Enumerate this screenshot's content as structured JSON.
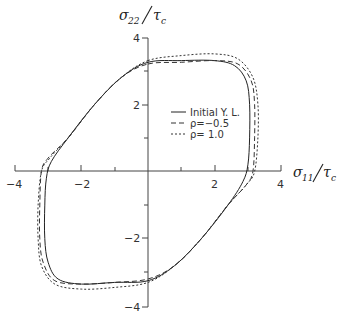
{
  "chart_data": {
    "type": "line",
    "title": "",
    "xlabel": "σ11/τc",
    "ylabel": "σ22/τc",
    "xlim": [
      -4,
      4
    ],
    "ylim": [
      -4,
      4
    ],
    "grid": false,
    "legend_position": "inside upper right",
    "x_ticks": [
      "-4",
      "-2",
      "2",
      "4"
    ],
    "y_ticks": [
      "4",
      "2",
      "-2",
      "-4"
    ],
    "series": [
      {
        "name": "Initial Y. L.",
        "style": "solid",
        "points": [
          [
            0,
            3.25
          ],
          [
            1.0,
            3.3
          ],
          [
            2.0,
            3.3
          ],
          [
            2.6,
            3.15
          ],
          [
            2.95,
            2.7
          ],
          [
            3.05,
            2.0
          ],
          [
            3.05,
            1.0
          ],
          [
            3.0,
            0.2
          ],
          [
            2.85,
            -0.3
          ],
          [
            2.4,
            -1.0
          ],
          [
            1.6,
            -2.0
          ],
          [
            0.8,
            -2.8
          ],
          [
            0,
            -3.25
          ],
          [
            -1.0,
            -3.3
          ],
          [
            -2.0,
            -3.35
          ],
          [
            -2.7,
            -3.2
          ],
          [
            -3.0,
            -2.7
          ],
          [
            -3.1,
            -2.0
          ],
          [
            -3.1,
            -1.0
          ],
          [
            -3.05,
            -0.2
          ],
          [
            -2.9,
            0.3
          ],
          [
            -2.4,
            1.0
          ],
          [
            -1.6,
            2.0
          ],
          [
            -0.8,
            2.8
          ],
          [
            0,
            3.25
          ]
        ]
      },
      {
        "name": "ρ=-0.5",
        "style": "dashed",
        "points": [
          [
            0,
            3.2
          ],
          [
            1.0,
            3.25
          ],
          [
            2.0,
            3.3
          ],
          [
            2.7,
            3.2
          ],
          [
            3.1,
            2.7
          ],
          [
            3.2,
            2.0
          ],
          [
            3.2,
            1.0
          ],
          [
            3.15,
            0.0
          ],
          [
            2.95,
            -0.4
          ],
          [
            2.4,
            -1.0
          ],
          [
            1.6,
            -2.0
          ],
          [
            0.8,
            -2.8
          ],
          [
            0,
            -3.2
          ],
          [
            -1.0,
            -3.3
          ],
          [
            -2.0,
            -3.35
          ],
          [
            -2.8,
            -3.25
          ],
          [
            -3.15,
            -2.7
          ],
          [
            -3.25,
            -2.0
          ],
          [
            -3.25,
            -1.0
          ],
          [
            -3.2,
            0.0
          ],
          [
            -3.0,
            0.4
          ],
          [
            -2.4,
            1.0
          ],
          [
            -1.6,
            2.0
          ],
          [
            -0.8,
            2.8
          ],
          [
            0,
            3.2
          ]
        ]
      },
      {
        "name": "ρ= 1.0",
        "style": "dotted",
        "points": [
          [
            0,
            3.3
          ],
          [
            1.0,
            3.45
          ],
          [
            2.0,
            3.5
          ],
          [
            2.7,
            3.35
          ],
          [
            3.15,
            2.8
          ],
          [
            3.3,
            2.0
          ],
          [
            3.3,
            1.0
          ],
          [
            3.2,
            0.0
          ],
          [
            2.95,
            -0.4
          ],
          [
            2.4,
            -1.0
          ],
          [
            1.6,
            -2.0
          ],
          [
            0.8,
            -2.8
          ],
          [
            0,
            -3.3
          ],
          [
            -1.0,
            -3.45
          ],
          [
            -2.0,
            -3.5
          ],
          [
            -2.8,
            -3.35
          ],
          [
            -3.2,
            -2.8
          ],
          [
            -3.3,
            -2.0
          ],
          [
            -3.3,
            -1.0
          ],
          [
            -3.2,
            0.0
          ],
          [
            -2.95,
            0.4
          ],
          [
            -2.4,
            1.0
          ],
          [
            -1.6,
            2.0
          ],
          [
            -0.8,
            2.8
          ],
          [
            0,
            3.3
          ]
        ]
      }
    ]
  },
  "axes": {
    "x_label_main": "σ",
    "x_label_sub": "11",
    "x_label_den": "τ",
    "x_label_den_sub": "c",
    "y_label_main": "σ",
    "y_label_sub": "22",
    "y_label_den": "τ",
    "y_label_den_sub": "c",
    "tick_x_neg4": "−4",
    "tick_x_neg2": "−2",
    "tick_x_2": "2",
    "tick_x_4": "4",
    "tick_y_4": "4",
    "tick_y_2": "2",
    "tick_y_neg2": "−2",
    "tick_y_neg4": "−4"
  },
  "legend": {
    "items": [
      {
        "label": "Initial  Y.  L."
      },
      {
        "label": "ρ=−0.5"
      },
      {
        "label": "ρ=  1.0"
      }
    ]
  }
}
